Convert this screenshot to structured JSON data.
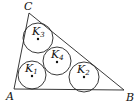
{
  "diagram": {
    "type": "geometry",
    "triangle": {
      "vertices": [
        {
          "name": "A",
          "x": 14,
          "y": 89
        },
        {
          "name": "B",
          "x": 124,
          "y": 90
        },
        {
          "name": "C",
          "x": 29,
          "y": 13
        }
      ]
    },
    "circles": [
      {
        "label": "K",
        "sub": "1",
        "cx": 32,
        "cy": 75,
        "r": 14
      },
      {
        "label": "K",
        "sub": "2",
        "cx": 84,
        "cy": 77,
        "r": 15
      },
      {
        "label": "K",
        "sub": "3",
        "cx": 38,
        "cy": 39,
        "r": 15
      },
      {
        "label": "K",
        "sub": "4",
        "cx": 57,
        "cy": 62,
        "r": 14
      }
    ]
  }
}
